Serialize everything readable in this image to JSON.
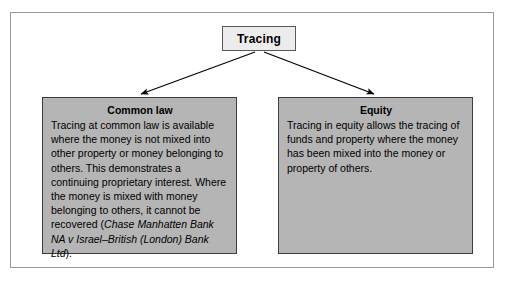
{
  "diagram": {
    "type": "tree",
    "root": {
      "label": "Tracing"
    },
    "branches": [
      {
        "id": "common-law",
        "title": "Common law",
        "body_before_citation": "Tracing at common law is available where the money is not mixed into other property or money belonging to others. This demonstrates a continuing proprietary interest. Where the money is mixed with money belonging to others, it cannot be recovered (",
        "citation": "Chase Manhatten Bank NA v Israel–British (London) Bank Ltd",
        "body_after_citation": ")."
      },
      {
        "id": "equity",
        "title": "Equity",
        "body_before_citation": "Tracing in equity allows the tracing of funds and property where the money has been mixed into the money or property of others.",
        "citation": "",
        "body_after_citation": ""
      }
    ]
  },
  "colors": {
    "page_background": "#ffffff",
    "frame_border": "#9a9a9a",
    "root_fill": "#ececec",
    "root_border": "#58585a",
    "branch_fill": "#b5b5b5",
    "branch_border": "#3d3d3d",
    "connector": "#000000",
    "text": "#000000"
  }
}
